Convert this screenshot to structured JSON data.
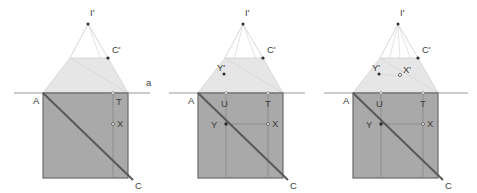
{
  "document": {
    "type": "geometry-diagram",
    "description": "Three-panel geometric construction showing a square with diagonal, a horizontal line a, and a projected trapezoid with apex point",
    "panel_count": 3
  },
  "colors": {
    "square_fill": "#a9a9a9",
    "trapezoid_fill": "#e6e6e6",
    "outline": "#6b6b6b",
    "diagonal": "#595959",
    "thin_line": "#9a9a9a",
    "ray_line": "#cfcfcf",
    "label_text": "#3d3d3d",
    "point_marker": "#2b2b2b",
    "background": "#ffffff"
  },
  "geometry": {
    "square": {
      "left": 43,
      "right": 128,
      "top": 93,
      "bottom": 178
    },
    "line_a_y": 93,
    "line_a_x1": 14,
    "line_a_x2": 150,
    "trapezoid_top_y": 58,
    "trapezoid_top_left_x": 70,
    "trapezoid_top_right_x": 108,
    "apex_x": 88,
    "apex_y": 24,
    "u_x": 71,
    "t_x": 113,
    "x_y": 124,
    "c_x": 133,
    "c_y": 180
  },
  "panels": [
    {
      "id": "panel-1",
      "name": "first-figure",
      "labels": [
        {
          "key": "I_prime",
          "text": "I'",
          "x": 90,
          "y": 16
        },
        {
          "key": "C_prime",
          "text": "C'",
          "x": 112,
          "y": 53
        },
        {
          "key": "a",
          "text": "a",
          "x": 146,
          "y": 86
        },
        {
          "key": "A",
          "text": "A",
          "x": 33,
          "y": 104
        },
        {
          "key": "T",
          "text": "T",
          "x": 116,
          "y": 105
        },
        {
          "key": "X",
          "text": "X",
          "x": 117,
          "y": 127
        },
        {
          "key": "C",
          "text": "C",
          "x": 135,
          "y": 189
        }
      ]
    },
    {
      "id": "panel-2",
      "name": "second-figure",
      "labels": [
        {
          "key": "I_prime",
          "text": "I'",
          "x": 90,
          "y": 16
        },
        {
          "key": "C_prime",
          "text": "C'",
          "x": 112,
          "y": 53
        },
        {
          "key": "Y_prime",
          "text": "Y'",
          "x": 62,
          "y": 71
        },
        {
          "key": "A",
          "text": "A",
          "x": 33,
          "y": 104
        },
        {
          "key": "U",
          "text": "U",
          "x": 66,
          "y": 107
        },
        {
          "key": "T",
          "text": "T",
          "x": 110,
          "y": 107
        },
        {
          "key": "Y",
          "text": "Y",
          "x": 56,
          "y": 128
        },
        {
          "key": "X",
          "text": "X",
          "x": 117,
          "y": 127
        },
        {
          "key": "C",
          "text": "C",
          "x": 135,
          "y": 189
        }
      ]
    },
    {
      "id": "panel-3",
      "name": "third-figure",
      "labels": [
        {
          "key": "I_prime",
          "text": "I'",
          "x": 90,
          "y": 16
        },
        {
          "key": "C_prime",
          "text": "C'",
          "x": 112,
          "y": 53
        },
        {
          "key": "Y_prime",
          "text": "Y'",
          "x": 62,
          "y": 71
        },
        {
          "key": "X_prime",
          "text": "X'",
          "x": 93,
          "y": 73
        },
        {
          "key": "A",
          "text": "A",
          "x": 33,
          "y": 104
        },
        {
          "key": "U",
          "text": "U",
          "x": 66,
          "y": 107
        },
        {
          "key": "T",
          "text": "T",
          "x": 110,
          "y": 107
        },
        {
          "key": "Y",
          "text": "Y",
          "x": 56,
          "y": 128
        },
        {
          "key": "X",
          "text": "X",
          "x": 117,
          "y": 127
        },
        {
          "key": "C",
          "text": "C",
          "x": 135,
          "y": 189
        }
      ]
    }
  ]
}
